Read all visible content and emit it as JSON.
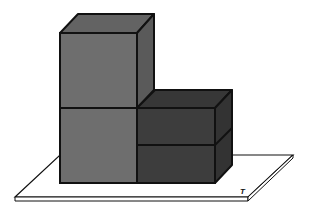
{
  "diagram": {
    "platform_label": "T",
    "blocks": [
      {
        "name": "tall-column-lower",
        "position": "left, bottom"
      },
      {
        "name": "tall-column-upper",
        "position": "left, top"
      },
      {
        "name": "short-box-lower",
        "position": "right, bottom"
      },
      {
        "name": "short-box-upper",
        "position": "right, top"
      }
    ],
    "colors": {
      "background": "#ffffff",
      "platform_fill": "#ffffff",
      "outline": "#111111",
      "tall_front": "#6e6e6e",
      "tall_top": "#636363",
      "tall_side": "#5a5a5a",
      "short_front": "#3d3d3d",
      "short_top": "#373737",
      "short_side": "#333333"
    }
  }
}
